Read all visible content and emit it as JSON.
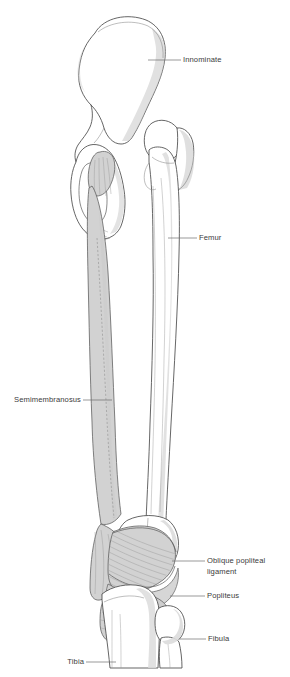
{
  "figure": {
    "background_color": "#ffffff",
    "line_color": "#4a4a4a",
    "muscle_fill": "#d2d2d2",
    "bone_fill": "#ffffff",
    "shadow_fill": "#c9c9c9",
    "label_color": "#3b3b3b",
    "leader_color": "#6e6e6e"
  },
  "labels": {
    "innominate": "Innominate",
    "femur": "Femur",
    "semimembranosus": "Semimembranosus",
    "oblique_popliteal_ligament_line1": "Oblique popliteal",
    "oblique_popliteal_ligament_line2": "ligament",
    "popliteus": "Popliteus",
    "fibula": "Fibula",
    "tibia": "Tibia"
  },
  "structures": [
    {
      "name": "innominate",
      "label": "Innominate",
      "type": "bone",
      "side": "right"
    },
    {
      "name": "femur",
      "label": "Femur",
      "type": "bone",
      "side": "right"
    },
    {
      "name": "semimembranosus",
      "label": "Semimembranosus",
      "type": "muscle",
      "side": "left"
    },
    {
      "name": "oblique-popliteal-ligament",
      "label": "Oblique popliteal ligament",
      "type": "ligament",
      "side": "right"
    },
    {
      "name": "popliteus",
      "label": "Popliteus",
      "type": "muscle",
      "side": "right"
    },
    {
      "name": "fibula",
      "label": "Fibula",
      "type": "bone",
      "side": "right"
    },
    {
      "name": "tibia",
      "label": "Tibia",
      "type": "bone",
      "side": "left"
    }
  ]
}
